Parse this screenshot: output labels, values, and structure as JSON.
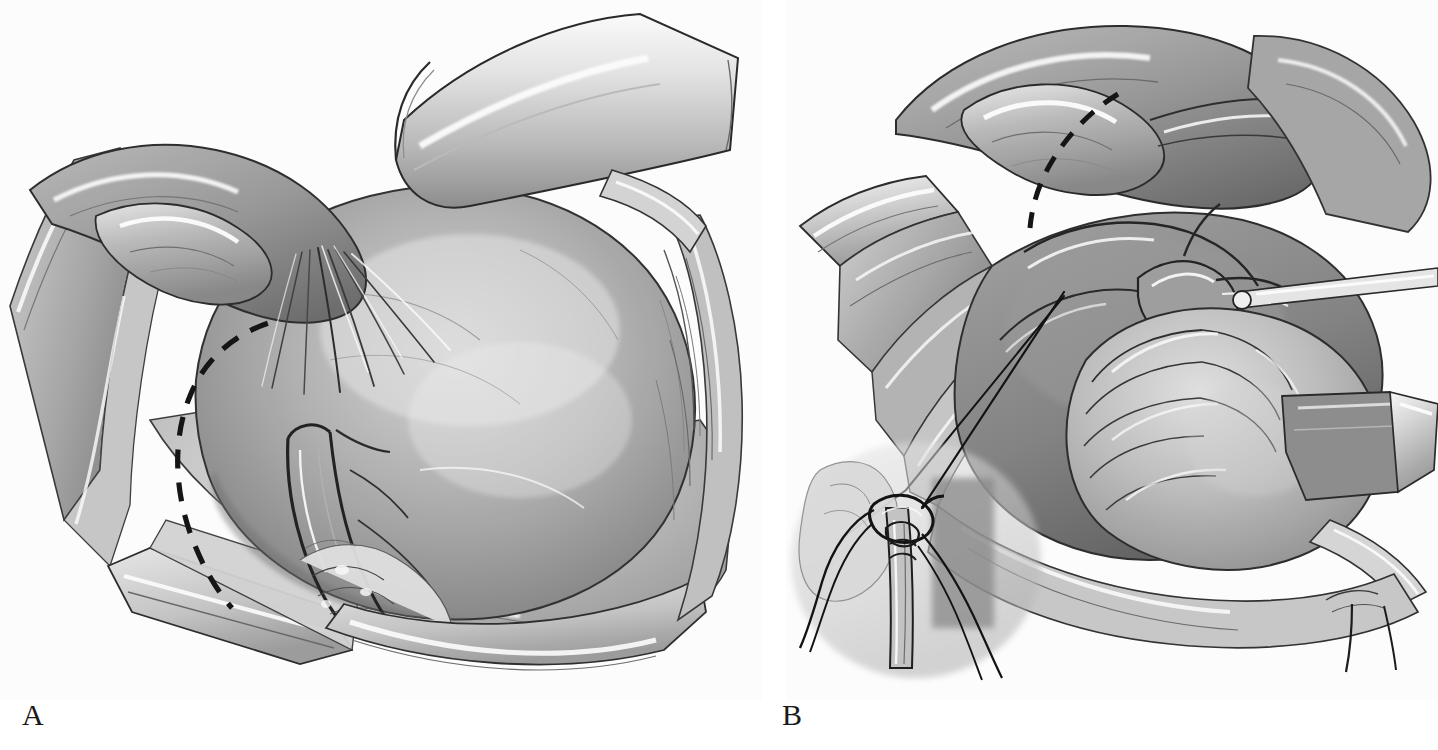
{
  "figure": {
    "type": "surgical-illustration",
    "medium": "grayscale pen-and-ink with wash / halftone print",
    "background_color": "#ffffff",
    "ink_color": "#1a1a1a",
    "panel_count": 2,
    "labels": {
      "panel_a": "A",
      "panel_b": "B"
    }
  },
  "panels": [
    {
      "id": "A",
      "label": "A",
      "caption_letter": "A",
      "description": "Operative field exposed by retractors showing a large rounded organ mass with an adjacent tubular structure and fan-like fimbrial fronds; a dashed curved line marks the planned incision.",
      "annotations": [
        {
          "name": "dashed-incision-line",
          "style": "dashed",
          "color": "#1a1a1a",
          "shape": "arc"
        }
      ],
      "structures": [
        "retractor-blade-top",
        "retractor-blade-left",
        "retractor-blade-right",
        "retractor-blade-bottom",
        "large-rounded-mass",
        "tubular-structure",
        "fimbrial-fronds",
        "vascular-pedicle",
        "abdominal-wall-edge"
      ]
    },
    {
      "id": "B",
      "label": "B",
      "caption_letter": "B",
      "description": "Same field after incision, with tissue reflected and bowel loops visible; a narrow instrument enters from the right and a leader line runs from the operative site down-left to a magnified inset showing a suture ligature being tied around a tubular structure.",
      "annotations": [
        {
          "name": "dashed-incision-line",
          "style": "dashed",
          "color": "#1a1a1a",
          "shape": "arc"
        },
        {
          "name": "inset-leader-line",
          "style": "solid",
          "color": "#1a1a1a",
          "shape": "line"
        }
      ],
      "structures": [
        "retractor-blade-left",
        "retractor-blade-top",
        "retractor-blade-bottom-right",
        "reflected-tissue-flap",
        "bowel-loops",
        "tubular-structure",
        "narrow-instrument-probe",
        "vascular-pedicle"
      ],
      "inset": {
        "name": "suture-ligature-inset",
        "description": "Magnified view of a suture being passed and tied around a tubular pedicle with free thread tails.",
        "elements": [
          "suture-thread",
          "needle",
          "tubular-pedicle",
          "thread-tails"
        ]
      }
    }
  ]
}
